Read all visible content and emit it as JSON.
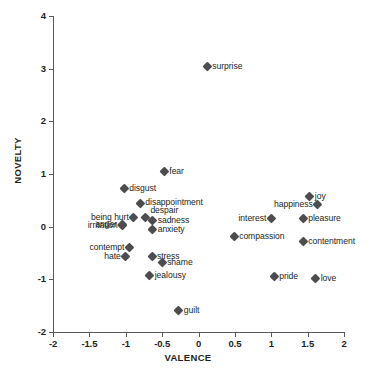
{
  "chart_data": {
    "type": "scatter",
    "title": "",
    "xlabel": "VALENCE",
    "ylabel": "NOVELTY",
    "xlim": [
      -2,
      2
    ],
    "ylim": [
      -2,
      4
    ],
    "xticks": [
      "-2",
      "-1.5",
      "-1",
      "-0.5",
      "0",
      "0.5",
      "1",
      "1.5",
      "2"
    ],
    "xtick_values": [
      -2,
      -1.5,
      -1,
      -0.5,
      0,
      0.5,
      1,
      1.5,
      2
    ],
    "yticks": [
      "-2",
      "-1",
      "0",
      "1",
      "2",
      "3",
      "4"
    ],
    "ytick_values": [
      -2,
      -1,
      0,
      1,
      2,
      3,
      4
    ],
    "grid": false,
    "legend": false,
    "marker": "diamond",
    "marker_color": "#4d4d4f",
    "points": [
      {
        "label": "surprise",
        "x": 0.12,
        "y": 3.04,
        "pos": "right"
      },
      {
        "label": "fear",
        "x": -0.47,
        "y": 1.05,
        "pos": "right"
      },
      {
        "label": "disgust",
        "x": -1.02,
        "y": 0.72,
        "pos": "right"
      },
      {
        "label": "joy",
        "x": 1.53,
        "y": 0.57,
        "pos": "right"
      },
      {
        "label": "disappointment",
        "x": -0.8,
        "y": 0.45,
        "pos": "right"
      },
      {
        "label": "happiness",
        "x": 1.64,
        "y": 0.42,
        "pos": "left"
      },
      {
        "label": "being hurt",
        "x": -0.89,
        "y": 0.18,
        "pos": "left"
      },
      {
        "label": "despair",
        "x": -0.73,
        "y": 0.17,
        "pos": "above"
      },
      {
        "label": "pleasure",
        "x": 1.44,
        "y": 0.16,
        "pos": "right"
      },
      {
        "label": "interest",
        "x": 1.0,
        "y": 0.16,
        "pos": "left"
      },
      {
        "label": "sadness",
        "x": -0.63,
        "y": 0.12,
        "pos": "right"
      },
      {
        "label": "anger",
        "x": -1.05,
        "y": 0.05,
        "pos": "left"
      },
      {
        "label": "irritation",
        "x": -1.04,
        "y": 0.02,
        "pos": "left"
      },
      {
        "label": "anxiety",
        "x": -0.63,
        "y": -0.05,
        "pos": "right"
      },
      {
        "label": "compassion",
        "x": 0.49,
        "y": -0.19,
        "pos": "right"
      },
      {
        "label": "contentment",
        "x": 1.44,
        "y": -0.28,
        "pos": "right"
      },
      {
        "label": "contempt",
        "x": -0.95,
        "y": -0.4,
        "pos": "left"
      },
      {
        "label": "hate",
        "x": -1.0,
        "y": -0.56,
        "pos": "left"
      },
      {
        "label": "stress",
        "x": -0.64,
        "y": -0.57,
        "pos": "right"
      },
      {
        "label": "shame",
        "x": -0.5,
        "y": -0.68,
        "pos": "right"
      },
      {
        "label": "jealousy",
        "x": -0.67,
        "y": -0.93,
        "pos": "right"
      },
      {
        "label": "pride",
        "x": 1.04,
        "y": -0.95,
        "pos": "right"
      },
      {
        "label": "love",
        "x": 1.61,
        "y": -0.98,
        "pos": "right"
      },
      {
        "label": "guilt",
        "x": -0.27,
        "y": -1.59,
        "pos": "right"
      }
    ]
  }
}
